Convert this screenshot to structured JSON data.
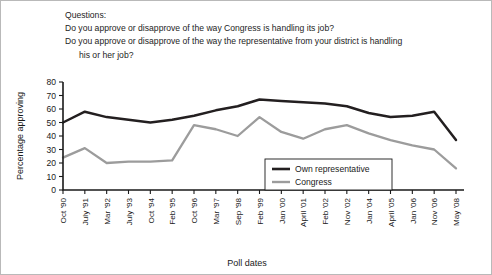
{
  "questions": {
    "heading": "Questions:",
    "q1": "Do you approve or disapprove of the way Congress is handling its job?",
    "q2": "Do you approve or disapprove of the way the representative from your district is handling",
    "q2_cont": "his or her job?"
  },
  "legend": {
    "own_label": "Own representative",
    "congress_label": "Congress"
  },
  "colors": {
    "own": "#231f20",
    "congress": "#9c9c9c",
    "axis": "#1a1a1a",
    "background": "#ffffff",
    "border": "#b9b9b9"
  },
  "chart_data": {
    "type": "line",
    "title": "",
    "xlabel": "Poll dates",
    "ylabel": "Percentage approving",
    "ylim": [
      0,
      80
    ],
    "yticks": [
      0,
      10,
      20,
      30,
      40,
      50,
      60,
      70,
      80
    ],
    "grid": false,
    "legend_position": "inside-right-lower",
    "categories": [
      "Oct '90",
      "July '91",
      "Mar '92",
      "July '93",
      "Oct '94",
      "Feb '95",
      "Oct '96",
      "Mar '97",
      "Sep '98",
      "Feb '99",
      "Jan '00",
      "April '01",
      "Feb '02",
      "Nov '02",
      "Jan '04",
      "April '05",
      "Jan '06",
      "Nov '06",
      "May '08"
    ],
    "series": [
      {
        "name": "Own representative",
        "values": [
          50,
          58,
          54,
          52,
          50,
          52,
          55,
          59,
          62,
          67,
          66,
          65,
          64,
          62,
          57,
          54,
          55,
          58,
          37
        ]
      },
      {
        "name": "Congress",
        "values": [
          24,
          31,
          20,
          21,
          21,
          22,
          48,
          45,
          40,
          54,
          43,
          38,
          45,
          48,
          42,
          37,
          33,
          30,
          16
        ]
      }
    ]
  }
}
